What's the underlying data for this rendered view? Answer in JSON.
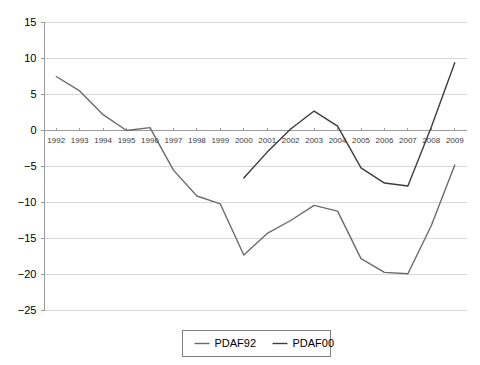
{
  "chart_data": {
    "type": "line",
    "title": "",
    "xlabel": "",
    "ylabel": "",
    "grid": true,
    "legend_position": "bottom-center",
    "ylim": [
      -25,
      15
    ],
    "ytick_step": 5,
    "yticks": [
      "15",
      "10",
      "5",
      "0",
      "-5",
      "-10",
      "-15",
      "-20",
      "-25"
    ],
    "categories": [
      "1992",
      "1993",
      "1994",
      "1995",
      "1996",
      "1997",
      "1998",
      "1999",
      "2000",
      "2001",
      "2002",
      "2003",
      "2004",
      "2005",
      "2006",
      "2007",
      "2008",
      "2009"
    ],
    "series": [
      {
        "name": "PDAF92",
        "color": "#6b6b6b",
        "values": [
          7.5,
          5.5,
          2.2,
          0.0,
          0.4,
          -5.5,
          -9.1,
          -10.2,
          -17.3,
          -14.3,
          -12.5,
          -10.4,
          -11.2,
          -17.8,
          -19.7,
          -19.9,
          -13.2,
          -4.8
        ]
      },
      {
        "name": "PDAF00",
        "color": "#3c3c3c",
        "values": [
          null,
          null,
          null,
          null,
          null,
          null,
          null,
          null,
          -6.6,
          -3.0,
          0.2,
          2.7,
          0.6,
          -5.2,
          -7.3,
          -7.7,
          0.5,
          9.4
        ]
      }
    ]
  },
  "legend": {
    "entries": [
      {
        "label": "PDAF92"
      },
      {
        "label": "PDAF00"
      }
    ]
  }
}
